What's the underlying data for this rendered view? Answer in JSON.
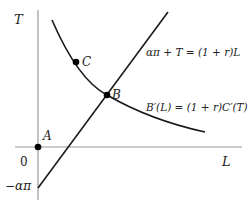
{
  "axes": {
    "y_label": "T",
    "x_label": "L",
    "origin_label": "0",
    "y_intercept_label": "−απ"
  },
  "points": {
    "A": "A",
    "B": "B",
    "C": "C"
  },
  "curves": {
    "budget_line": "απ + T = (1 + r)L",
    "optimality_curve": "B′(L) = (1 + r)C′(T)"
  },
  "colors": {
    "axis": "#9a9a9a",
    "curve": "#1a1a1a"
  }
}
